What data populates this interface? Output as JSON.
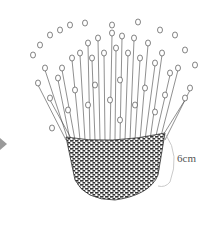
{
  "illustration": {
    "subject": "woven basket with flowering plants",
    "measurement_label": "6cm",
    "arrow_icon": "play-arrow-icon",
    "colors": {
      "line": "#3a3a3a",
      "arrow": "#9a9a9a",
      "dimension_line": "#bdbdbd",
      "background": "#ffffff"
    }
  }
}
